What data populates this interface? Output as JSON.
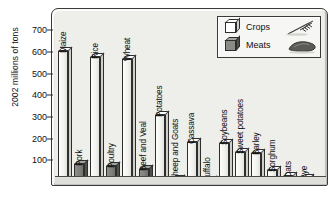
{
  "chart_data": {
    "type": "bar",
    "title": "",
    "xlabel": "",
    "ylabel": "2002 millions of tons",
    "ylim": [
      0,
      760
    ],
    "ytick_values": [
      100,
      200,
      300,
      400,
      500,
      600,
      700
    ],
    "ytick_labels": [
      "100",
      "200",
      "300",
      "400",
      "500",
      "600",
      "700"
    ],
    "grid": false,
    "legend_position": "top-right",
    "categories": [
      "Maize",
      "Pork",
      "Rice",
      "Poultry",
      "Wheat",
      "Beef and Veal",
      "Potatoes",
      "Sheep and Goats",
      "Cassava",
      "Buffalo",
      "Soybeans",
      "Sweet potatoes",
      "Barley",
      "Sorghum",
      "Oats",
      "Rye"
    ],
    "values": [
      602,
      85,
      578,
      74,
      568,
      58,
      310,
      12,
      185,
      3,
      180,
      140,
      135,
      57,
      27,
      20
    ],
    "groups": [
      "Crops",
      "Meats",
      "Crops",
      "Meats",
      "Crops",
      "Meats",
      "Crops",
      "Meats",
      "Crops",
      "Meats",
      "Crops",
      "Crops",
      "Crops",
      "Crops",
      "Crops",
      "Crops"
    ],
    "series": [
      {
        "name": "Crops",
        "color": "#f2f2ee",
        "points": [
          {
            "label": "Maize",
            "value": 602
          },
          {
            "label": "Rice",
            "value": 578
          },
          {
            "label": "Wheat",
            "value": 568
          },
          {
            "label": "Potatoes",
            "value": 310
          },
          {
            "label": "Cassava",
            "value": 185
          },
          {
            "label": "Soybeans",
            "value": 180
          },
          {
            "label": "Sweet potatoes",
            "value": 140
          },
          {
            "label": "Barley",
            "value": 135
          },
          {
            "label": "Sorghum",
            "value": 57
          },
          {
            "label": "Oats",
            "value": 27
          },
          {
            "label": "Rye",
            "value": 20
          }
        ]
      },
      {
        "name": "Meats",
        "color": "#7e7e7a",
        "points": [
          {
            "label": "Pork",
            "value": 85
          },
          {
            "label": "Poultry",
            "value": 74
          },
          {
            "label": "Beef and Veal",
            "value": 58
          },
          {
            "label": "Sheep and Goats",
            "value": 12
          },
          {
            "label": "Buffalo",
            "value": 3
          }
        ]
      }
    ]
  },
  "legend": {
    "items": [
      {
        "label": "Crops",
        "swatch": "crops-cube-icon",
        "picture": "wheat-stalk-icon"
      },
      {
        "label": "Meats",
        "swatch": "meats-cube-icon",
        "picture": "meat-slab-icon"
      }
    ]
  }
}
